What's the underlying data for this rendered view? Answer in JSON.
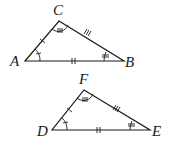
{
  "diagram": {
    "triangles": [
      {
        "name": "triangle-abc",
        "vertices": [
          {
            "label": "A",
            "x": 25,
            "y": 61,
            "label_x": 10,
            "label_y": 66
          },
          {
            "label": "B",
            "x": 124,
            "y": 61,
            "label_x": 125,
            "label_y": 67
          },
          {
            "label": "C",
            "x": 59,
            "y": 21,
            "label_x": 53,
            "label_y": 15
          }
        ],
        "side_marks": {
          "AC": 1,
          "AB": 2,
          "CB": 3
        },
        "angle_marks": {
          "A": 1,
          "B": 2,
          "C": 3
        }
      },
      {
        "name": "triangle-def",
        "vertices": [
          {
            "label": "D",
            "x": 52,
            "y": 130,
            "label_x": 37,
            "label_y": 136
          },
          {
            "label": "E",
            "x": 150,
            "y": 130,
            "label_x": 152,
            "label_y": 136
          },
          {
            "label": "F",
            "x": 84,
            "y": 90,
            "label_x": 79,
            "label_y": 84
          }
        ],
        "side_marks": {
          "DF": 1,
          "DE": 2,
          "FE": 3
        },
        "angle_marks": {
          "D": 1,
          "E": 2,
          "F": 3
        }
      }
    ]
  }
}
